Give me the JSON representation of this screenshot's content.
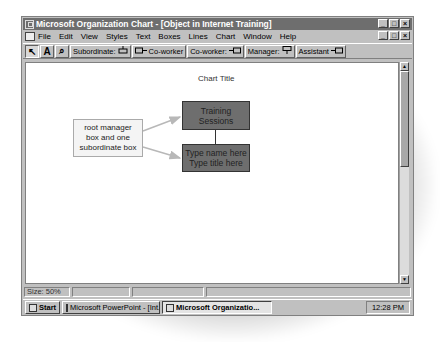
{
  "window": {
    "title": "Microsoft Organization Chart - [Object in Internet Training]",
    "controls": [
      "_",
      "□",
      "×"
    ]
  },
  "menubar": {
    "items": [
      {
        "label": "File",
        "accel": "F"
      },
      {
        "label": "Edit",
        "accel": "E"
      },
      {
        "label": "View",
        "accel": "V"
      },
      {
        "label": "Styles",
        "accel": "S"
      },
      {
        "label": "Text",
        "accel": "T"
      },
      {
        "label": "Boxes",
        "accel": "B"
      },
      {
        "label": "Lines",
        "accel": "L"
      },
      {
        "label": "Chart",
        "accel": "C"
      },
      {
        "label": "Window",
        "accel": "W"
      },
      {
        "label": "Help",
        "accel": "H"
      }
    ]
  },
  "toolbar": {
    "select_tool": "↖",
    "text_tool": "A",
    "zoom_tool": "⌕",
    "subordinate": "Subordinate:",
    "coworker_left": "Co-worker",
    "coworker_right": "Co-worker:",
    "manager": "Manager:",
    "assistant": "Assistant"
  },
  "chart": {
    "title": "Chart Title",
    "root_box": {
      "line1": "Training",
      "line2": "Sessions"
    },
    "sub_box": {
      "line1": "Type name here",
      "line2": "Type title here"
    },
    "callout": {
      "line1": "root manager",
      "line2": "box and one",
      "line3": "subordinate box"
    }
  },
  "status": {
    "size": "Size: 50%"
  },
  "taskbar": {
    "start": "Start",
    "tasks": [
      {
        "label": "Microsoft PowerPoint - [Int...",
        "active": false
      },
      {
        "label": "Microsoft Organizatio...",
        "active": true
      }
    ],
    "clock": "12:28 PM"
  }
}
